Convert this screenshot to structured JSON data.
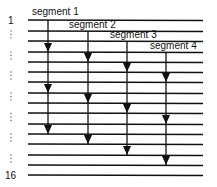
{
  "diagram": {
    "row_labels": {
      "first": "1",
      "last": "16",
      "ellipsis": "⋮"
    },
    "rows": 16,
    "row_y": [
      20,
      31,
      41,
      52,
      62,
      72,
      82,
      93,
      103,
      113,
      124,
      134,
      144,
      155,
      165,
      175
    ],
    "ellipsis_rows": [
      1,
      3,
      5,
      7,
      9,
      11,
      13
    ],
    "segments": [
      {
        "label": "segment 1",
        "x": 48,
        "start_row": 0,
        "arrow_rows": [
          3,
          7,
          11
        ]
      },
      {
        "label": "segment 2",
        "x": 88,
        "start_row": 1,
        "arrow_rows": [
          4,
          8,
          12
        ]
      },
      {
        "label": "segment 3",
        "x": 127,
        "start_row": 2,
        "arrow_rows": [
          5,
          9,
          13
        ]
      },
      {
        "label": "segment 4",
        "x": 166,
        "start_row": 3,
        "arrow_rows": [
          6,
          10,
          14
        ]
      }
    ],
    "line_x_start": 28,
    "line_x_end": 203,
    "color": "#111111"
  }
}
